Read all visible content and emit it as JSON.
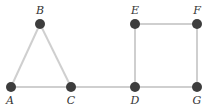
{
  "diagram": {
    "type": "graph",
    "colors": {
      "node": "#3d3d3d",
      "edge": "#cfcfcf",
      "label": "#333333"
    },
    "nodes": [
      {
        "id": "A",
        "label": "A",
        "x": 11,
        "y": 87,
        "label_x": 10,
        "label_y": 104
      },
      {
        "id": "B",
        "label": "B",
        "x": 40,
        "y": 24,
        "label_x": 40,
        "label_y": 14
      },
      {
        "id": "C",
        "label": "C",
        "x": 71,
        "y": 87,
        "label_x": 71,
        "label_y": 104
      },
      {
        "id": "D",
        "label": "D",
        "x": 135,
        "y": 87,
        "label_x": 135,
        "label_y": 104
      },
      {
        "id": "E",
        "label": "E",
        "x": 135,
        "y": 24,
        "label_x": 135,
        "label_y": 14
      },
      {
        "id": "F",
        "label": "F",
        "x": 197,
        "y": 24,
        "label_x": 197,
        "label_y": 14
      },
      {
        "id": "G",
        "label": "G",
        "x": 197,
        "y": 87,
        "label_x": 197,
        "label_y": 104
      }
    ],
    "edges": [
      [
        "A",
        "B"
      ],
      [
        "B",
        "C"
      ],
      [
        "A",
        "C"
      ],
      [
        "C",
        "D"
      ],
      [
        "D",
        "E"
      ],
      [
        "E",
        "F"
      ],
      [
        "F",
        "G"
      ],
      [
        "D",
        "G"
      ]
    ]
  }
}
